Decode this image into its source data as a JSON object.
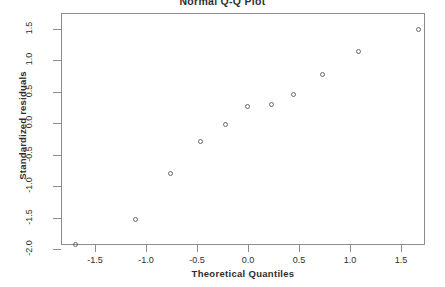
{
  "chart_data": {
    "type": "scatter",
    "title": "Normal Q-Q Plot",
    "xlabel": "Theoretical Quantiles",
    "ylabel": "Standardized residuals",
    "grid": false,
    "legend": null,
    "xlim": [
      -1.82,
      1.8
    ],
    "ylim": [
      -2.08,
      1.65
    ],
    "xticks": [
      "-1.5",
      "-1.0",
      "-0.5",
      "0.0",
      "0.5",
      "1.0",
      "1.5"
    ],
    "xtick_values": [
      -1.5,
      -1.0,
      -0.5,
      0.0,
      0.5,
      1.0,
      1.5
    ],
    "yticks": [
      "1.5",
      "1.0",
      "0.5",
      "0.0",
      "-0.5",
      "-1.0",
      "-1.5",
      "-2.0"
    ],
    "ytick_values": [
      1.5,
      1.0,
      0.5,
      0.0,
      -0.5,
      -1.0,
      -1.5,
      -2.0
    ],
    "x": [
      -1.69,
      -1.1,
      -0.76,
      -0.47,
      -0.22,
      -0.01,
      0.23,
      0.45,
      0.73,
      1.08,
      1.67
    ],
    "y": [
      -1.93,
      -1.53,
      -0.8,
      -0.3,
      -0.02,
      0.27,
      0.29,
      0.45,
      0.77,
      1.13,
      1.49
    ],
    "points": [
      {
        "x": -1.69,
        "y": -1.93
      },
      {
        "x": -1.1,
        "y": -1.53
      },
      {
        "x": -0.76,
        "y": -0.8
      },
      {
        "x": -0.47,
        "y": -0.3
      },
      {
        "x": -0.22,
        "y": -0.02
      },
      {
        "x": -0.01,
        "y": 0.27
      },
      {
        "x": 0.23,
        "y": 0.29
      },
      {
        "x": 0.45,
        "y": 0.45
      },
      {
        "x": 0.73,
        "y": 0.77
      },
      {
        "x": 1.08,
        "y": 1.13
      },
      {
        "x": 1.67,
        "y": 1.49
      }
    ],
    "marker": "open-circle",
    "marker_color": "#6b6b6b",
    "axis_color": "#8c8c8c",
    "background": "#ffffff"
  }
}
